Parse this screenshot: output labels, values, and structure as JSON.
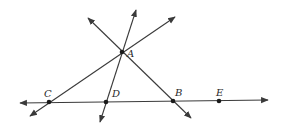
{
  "diagram": {
    "type": "geometry-lines",
    "colors": {
      "line": "#3a3a3a",
      "point": "#1a1a1a",
      "label": "#2a2a2a",
      "background": "#ffffff"
    },
    "points": [
      {
        "id": "A",
        "label": "A",
        "x": 122,
        "y": 52,
        "lx": 127,
        "ly": 57
      },
      {
        "id": "C",
        "label": "C",
        "x": 49,
        "y": 102,
        "lx": 44,
        "ly": 97
      },
      {
        "id": "D",
        "label": "D",
        "x": 106,
        "y": 102,
        "lx": 112,
        "ly": 97
      },
      {
        "id": "B",
        "label": "B",
        "x": 173,
        "y": 101,
        "lx": 175,
        "ly": 96
      },
      {
        "id": "E",
        "label": "E",
        "x": 219,
        "y": 101,
        "lx": 216,
        "ly": 96
      }
    ],
    "lines": [
      {
        "id": "line-CE",
        "through": [
          "C",
          "D",
          "B",
          "E"
        ],
        "x1": 20,
        "y1": 103,
        "x2": 268,
        "y2": 100
      },
      {
        "id": "line-CA",
        "through": [
          "C",
          "A"
        ],
        "x1": 30,
        "y1": 116,
        "x2": 175,
        "y2": 17
      },
      {
        "id": "line-DA",
        "through": [
          "D",
          "A"
        ],
        "x1": 100,
        "y1": 122,
        "x2": 136,
        "y2": 10
      },
      {
        "id": "line-AB",
        "through": [
          "A",
          "B"
        ],
        "x1": 88,
        "y1": 18,
        "x2": 191,
        "y2": 118
      }
    ]
  }
}
